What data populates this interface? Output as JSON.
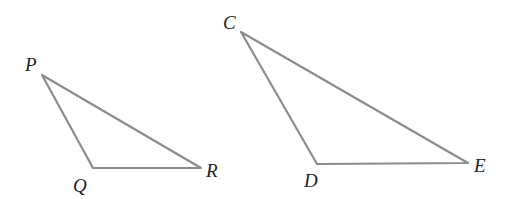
{
  "diagram": {
    "type": "geometry-similar-triangles",
    "line_color": "#8c8c8c",
    "label_color": "#1e1e1e",
    "triangles": [
      {
        "name": "PQR",
        "vertices": [
          {
            "label": "P",
            "x": 42,
            "y": 75,
            "label_x": 25,
            "label_y": 71
          },
          {
            "label": "Q",
            "x": 93,
            "y": 168,
            "label_x": 73,
            "label_y": 192
          },
          {
            "label": "R",
            "x": 201,
            "y": 168,
            "label_x": 206,
            "label_y": 177
          }
        ]
      },
      {
        "name": "CDE",
        "vertices": [
          {
            "label": "C",
            "x": 241,
            "y": 32,
            "label_x": 223,
            "label_y": 29
          },
          {
            "label": "D",
            "x": 317,
            "y": 164,
            "label_x": 304,
            "label_y": 187
          },
          {
            "label": "E",
            "x": 468,
            "y": 163,
            "label_x": 474,
            "label_y": 172
          }
        ]
      }
    ]
  }
}
